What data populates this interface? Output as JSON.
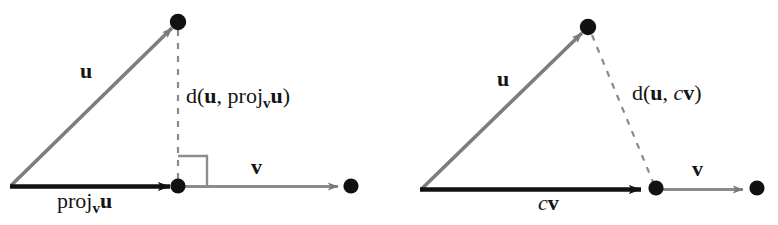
{
  "figure": {
    "background_color": "#ffffff",
    "width": 778,
    "height": 225,
    "vector_gray": "#7a7a7a",
    "vector_black": "#111111",
    "dash_gray": "#8a8a8a",
    "dot_color": "#111111"
  },
  "left_diagram": {
    "name": "orthogonal-projection-diagram",
    "labels": {
      "u": "u",
      "v": "v",
      "projection": {
        "head": "proj",
        "subscript": "v",
        "tail": "u"
      },
      "distance": {
        "open": "d(",
        "first": "u",
        "comma": ", ",
        "proj_head": "proj",
        "proj_sub": "v",
        "proj_tail": "u",
        "close": ")"
      }
    },
    "geometry": {
      "origin": [
        10,
        186
      ],
      "u_tip": [
        178,
        22
      ],
      "proj_tip": [
        178,
        186
      ],
      "v_tip": [
        340,
        186
      ],
      "v_endpoint_dot": [
        351,
        186
      ],
      "right_angle_marker": true
    }
  },
  "right_diagram": {
    "name": "scalar-multiple-distance-diagram",
    "labels": {
      "u": "u",
      "v": "v",
      "cv": {
        "scalar": "c",
        "vector": "v"
      },
      "distance": {
        "open": "d(",
        "first": "u",
        "comma": ", ",
        "scalar": "c",
        "vector": "v",
        "close": ")"
      }
    },
    "geometry": {
      "origin": [
        420,
        190
      ],
      "u_tip": [
        588,
        27
      ],
      "cv_tip": [
        648,
        190
      ],
      "cv_endpoint_dot": [
        656,
        188
      ],
      "v_tip": [
        745,
        190
      ],
      "v_endpoint_dot": [
        757,
        188
      ],
      "right_angle_marker": false
    }
  }
}
